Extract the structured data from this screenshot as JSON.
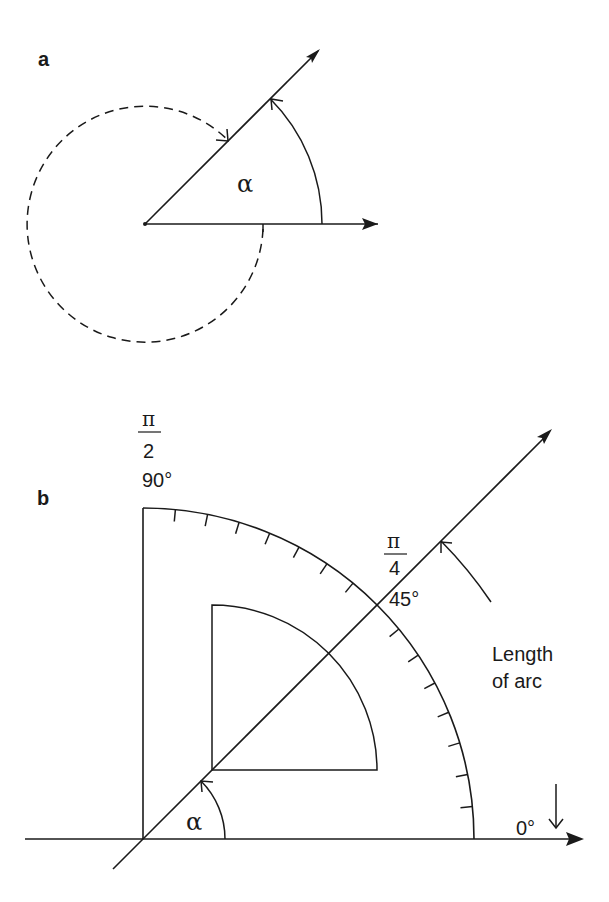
{
  "figure": {
    "stroke_color": "#1a1a1a",
    "background": "#ffffff"
  },
  "panel_a": {
    "label": "a",
    "angle_symbol": "α",
    "origin": [
      145,
      224
    ],
    "ray_angle_deg": 45,
    "ray_length": 248,
    "axis_length": 233,
    "solid_arc_radius": 177,
    "dashed_arc_radius": 118,
    "dashed_arc_description": "reflex angle (360° − α) drawn dashed, clockwise from horizontal to ray"
  },
  "panel_b": {
    "label": "b",
    "angle_symbol": "α",
    "origin": [
      143,
      839
    ],
    "axis_start_x": 25,
    "axis_end_x": 583,
    "outer_radius": 331,
    "inner_radius": 165,
    "inner_corner": [
      212,
      770
    ],
    "small_arc_radius": 82,
    "tick_divisions": 16,
    "tick_length": 12,
    "length_arc_radius": 421,
    "length_arc_from_deg": 34,
    "length_arc_to_deg": 45,
    "labels": {
      "pi_half_num": "π",
      "pi_half_den": "2",
      "deg_90": "90°",
      "pi_quarter_num": "π",
      "pi_quarter_den": "4",
      "deg_45": "45°",
      "deg_0": "0°",
      "length_line1": "Length",
      "length_line2": "of arc"
    }
  }
}
